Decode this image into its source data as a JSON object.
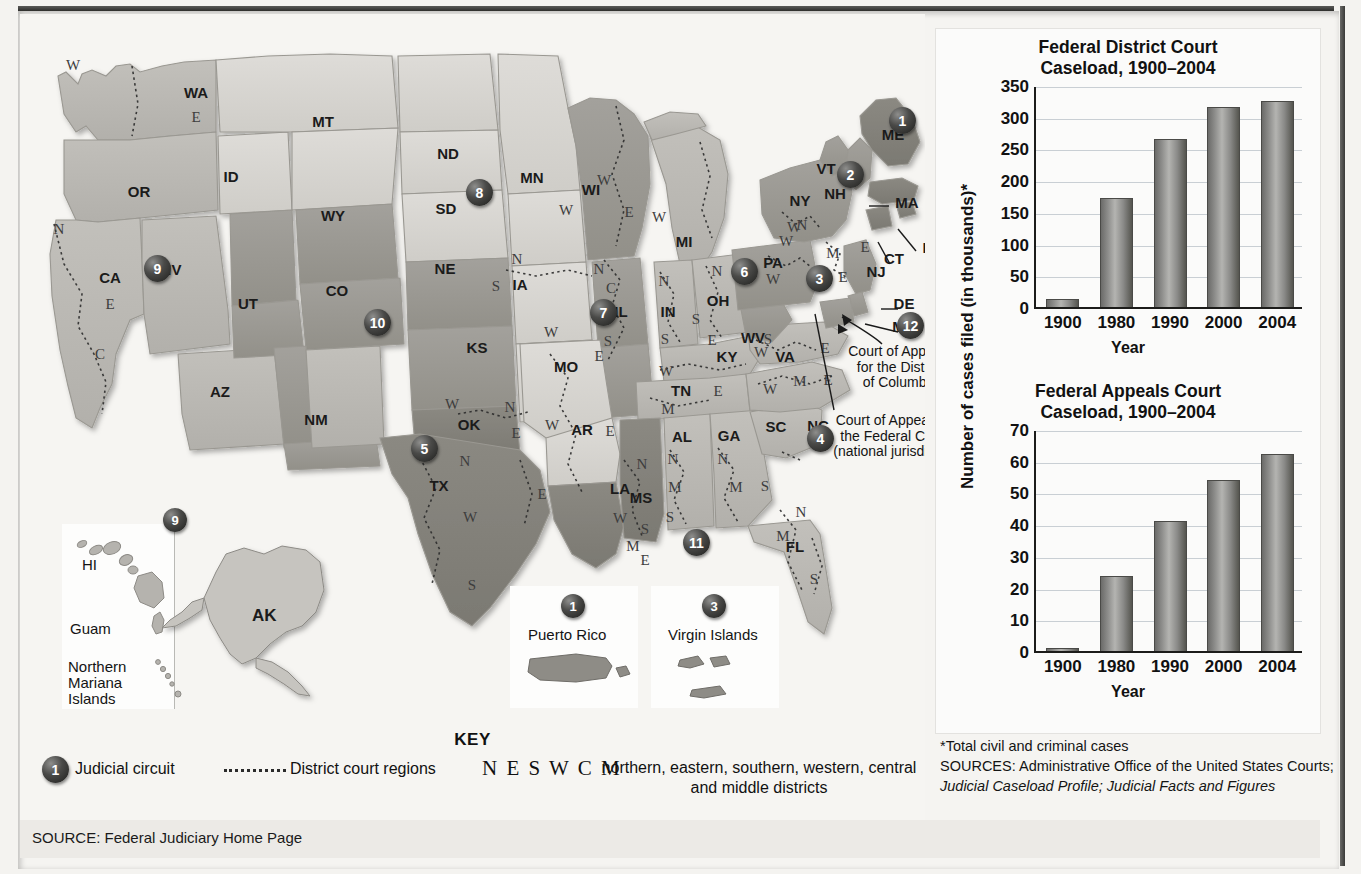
{
  "source_strip": {
    "text": "SOURCE: Federal Judiciary Home Page"
  },
  "key": {
    "title": "KEY",
    "circuit_badge": "1",
    "circuit_label": "Judicial circuit",
    "district_label": "District court regions",
    "neswcm": "N E S W C M",
    "neswcm_desc": "northern, eastern, southern, western, central and middle districts"
  },
  "map": {
    "states": [
      {
        "code": "WA",
        "x": 176,
        "y": 84
      },
      {
        "code": "OR",
        "x": 119,
        "y": 183
      },
      {
        "code": "ID",
        "x": 211,
        "y": 168
      },
      {
        "code": "MT",
        "x": 303,
        "y": 113
      },
      {
        "code": "WY",
        "x": 313,
        "y": 207
      },
      {
        "code": "NV",
        "x": 151,
        "y": 261
      },
      {
        "code": "CA",
        "x": 90,
        "y": 269
      },
      {
        "code": "UT",
        "x": 228,
        "y": 295
      },
      {
        "code": "CO",
        "x": 317,
        "y": 282
      },
      {
        "code": "AZ",
        "x": 200,
        "y": 383
      },
      {
        "code": "NM",
        "x": 296,
        "y": 411
      },
      {
        "code": "ND",
        "x": 428,
        "y": 145
      },
      {
        "code": "SD",
        "x": 426,
        "y": 200
      },
      {
        "code": "NE",
        "x": 425,
        "y": 260
      },
      {
        "code": "KS",
        "x": 457,
        "y": 339
      },
      {
        "code": "OK",
        "x": 449,
        "y": 416
      },
      {
        "code": "TX",
        "x": 419,
        "y": 477
      },
      {
        "code": "MN",
        "x": 512,
        "y": 169
      },
      {
        "code": "IA",
        "x": 500,
        "y": 276
      },
      {
        "code": "MO",
        "x": 546,
        "y": 358
      },
      {
        "code": "AR",
        "x": 562,
        "y": 421
      },
      {
        "code": "LA",
        "x": 600,
        "y": 480
      },
      {
        "code": "WI",
        "x": 571,
        "y": 181
      },
      {
        "code": "IL",
        "x": 601,
        "y": 303
      },
      {
        "code": "MI",
        "x": 664,
        "y": 233
      },
      {
        "code": "IN",
        "x": 648,
        "y": 303
      },
      {
        "code": "OH",
        "x": 698,
        "y": 292
      },
      {
        "code": "KY",
        "x": 707,
        "y": 348
      },
      {
        "code": "TN",
        "x": 661,
        "y": 382
      },
      {
        "code": "MS",
        "x": 621,
        "y": 489
      },
      {
        "code": "AL",
        "x": 662,
        "y": 428
      },
      {
        "code": "GA",
        "x": 709,
        "y": 427
      },
      {
        "code": "FL",
        "x": 775,
        "y": 538
      },
      {
        "code": "SC",
        "x": 756,
        "y": 418
      },
      {
        "code": "NC",
        "x": 798,
        "y": 417
      },
      {
        "code": "VA",
        "x": 765,
        "y": 348
      },
      {
        "code": "WV",
        "x": 733,
        "y": 329
      },
      {
        "code": "PA",
        "x": 753,
        "y": 254
      },
      {
        "code": "NY",
        "x": 780,
        "y": 192
      },
      {
        "code": "VT",
        "x": 806,
        "y": 160
      },
      {
        "code": "NH",
        "x": 815,
        "y": 185
      },
      {
        "code": "ME",
        "x": 873,
        "y": 126
      },
      {
        "code": "NJ",
        "x": 856,
        "y": 263
      },
      {
        "code": "MA",
        "x": 887,
        "y": 194
      },
      {
        "code": "RI",
        "x": 910,
        "y": 239
      },
      {
        "code": "CT",
        "x": 874,
        "y": 250
      },
      {
        "code": "DE",
        "x": 884,
        "y": 295
      },
      {
        "code": "MD",
        "x": 884,
        "y": 318
      },
      {
        "code": "AK",
        "x": 253,
        "y": 602
      },
      {
        "code": "HI",
        "x": 80,
        "y": 542
      }
    ],
    "district_letters": [
      {
        "t": "W",
        "x": 53,
        "y": 56
      },
      {
        "t": "E",
        "x": 176,
        "y": 108
      },
      {
        "t": "N",
        "x": 39,
        "y": 220
      },
      {
        "t": "E",
        "x": 90,
        "y": 295
      },
      {
        "t": "C",
        "x": 80,
        "y": 345
      },
      {
        "t": "N",
        "x": 497,
        "y": 250
      },
      {
        "t": "S",
        "x": 476,
        "y": 277
      },
      {
        "t": "W",
        "x": 584,
        "y": 171
      },
      {
        "t": "W",
        "x": 546,
        "y": 201
      },
      {
        "t": "E",
        "x": 609,
        "y": 203
      },
      {
        "t": "W",
        "x": 639,
        "y": 208
      },
      {
        "t": "N",
        "x": 579,
        "y": 260
      },
      {
        "t": "C",
        "x": 591,
        "y": 279
      },
      {
        "t": "S",
        "x": 588,
        "y": 332
      },
      {
        "t": "N",
        "x": 644,
        "y": 272
      },
      {
        "t": "S",
        "x": 645,
        "y": 330
      },
      {
        "t": "N",
        "x": 697,
        "y": 262
      },
      {
        "t": "S",
        "x": 676,
        "y": 310
      },
      {
        "t": "E",
        "x": 692,
        "y": 331
      },
      {
        "t": "W",
        "x": 531,
        "y": 323
      },
      {
        "t": "E",
        "x": 579,
        "y": 347
      },
      {
        "t": "W",
        "x": 432,
        "y": 395
      },
      {
        "t": "N",
        "x": 490,
        "y": 398
      },
      {
        "t": "E",
        "x": 496,
        "y": 424
      },
      {
        "t": "W",
        "x": 532,
        "y": 416
      },
      {
        "t": "E",
        "x": 590,
        "y": 422
      },
      {
        "t": "N",
        "x": 445,
        "y": 452
      },
      {
        "t": "W",
        "x": 450,
        "y": 508
      },
      {
        "t": "S",
        "x": 452,
        "y": 576
      },
      {
        "t": "E",
        "x": 522,
        "y": 485
      },
      {
        "t": "W",
        "x": 600,
        "y": 509
      },
      {
        "t": "M",
        "x": 613,
        "y": 537
      },
      {
        "t": "E",
        "x": 625,
        "y": 551
      },
      {
        "t": "N",
        "x": 622,
        "y": 455
      },
      {
        "t": "S",
        "x": 625,
        "y": 520
      },
      {
        "t": "N",
        "x": 653,
        "y": 450
      },
      {
        "t": "M",
        "x": 655,
        "y": 478
      },
      {
        "t": "S",
        "x": 650,
        "y": 508
      },
      {
        "t": "N",
        "x": 703,
        "y": 450
      },
      {
        "t": "M",
        "x": 716,
        "y": 478
      },
      {
        "t": "S",
        "x": 745,
        "y": 477
      },
      {
        "t": "N",
        "x": 781,
        "y": 503
      },
      {
        "t": "M",
        "x": 763,
        "y": 527
      },
      {
        "t": "S",
        "x": 794,
        "y": 570
      },
      {
        "t": "W",
        "x": 646,
        "y": 362
      },
      {
        "t": "M",
        "x": 648,
        "y": 400
      },
      {
        "t": "E",
        "x": 698,
        "y": 382
      },
      {
        "t": "W",
        "x": 750,
        "y": 380
      },
      {
        "t": "M",
        "x": 780,
        "y": 372
      },
      {
        "t": "E",
        "x": 808,
        "y": 371
      },
      {
        "t": "W",
        "x": 741,
        "y": 343
      },
      {
        "t": "S",
        "x": 748,
        "y": 330
      },
      {
        "t": "E",
        "x": 805,
        "y": 339
      },
      {
        "t": "W",
        "x": 753,
        "y": 270
      },
      {
        "t": "W",
        "x": 774,
        "y": 218
      },
      {
        "t": "M",
        "x": 813,
        "y": 244
      },
      {
        "t": "N",
        "x": 782,
        "y": 216
      },
      {
        "t": "E",
        "x": 845,
        "y": 238
      },
      {
        "t": "E",
        "x": 823,
        "y": 268
      },
      {
        "t": "W",
        "x": 766,
        "y": 232
      }
    ],
    "badges": [
      {
        "n": "1",
        "x": 869,
        "y": 93,
        "size": "big"
      },
      {
        "n": "2",
        "x": 817,
        "y": 147,
        "size": "big"
      },
      {
        "n": "3",
        "x": 786,
        "y": 251,
        "size": "big"
      },
      {
        "n": "4",
        "x": 787,
        "y": 411,
        "size": "big"
      },
      {
        "n": "5",
        "x": 391,
        "y": 421,
        "size": "big"
      },
      {
        "n": "6",
        "x": 711,
        "y": 244,
        "size": "big"
      },
      {
        "n": "7",
        "x": 570,
        "y": 285,
        "size": "big"
      },
      {
        "n": "8",
        "x": 446,
        "y": 165,
        "size": "big"
      },
      {
        "n": "9",
        "x": 124,
        "y": 241,
        "size": "big"
      },
      {
        "n": "10",
        "x": 344,
        "y": 295,
        "size": "big"
      },
      {
        "n": "11",
        "x": 663,
        "y": 515,
        "size": "big"
      },
      {
        "n": "12",
        "x": 877,
        "y": 298,
        "size": "big"
      }
    ],
    "notes": [
      {
        "lines": [
          "Court of Appeals",
          "for the District",
          "of Columbia"
        ],
        "x": 800,
        "y": 330,
        "w": 160
      },
      {
        "lines": [
          "Court of Appeals for",
          "the Federal Circuit",
          "(national jurisdiction)"
        ],
        "x": 790,
        "y": 399,
        "w": 175
      }
    ],
    "insets": [
      {
        "name": "hawaii",
        "label": "HI"
      },
      {
        "name": "guam",
        "label": "Guam"
      },
      {
        "name": "northern-mariana",
        "label": "Northern\nMariana\nIslands"
      },
      {
        "name": "puerto-rico",
        "label": "Puerto Rico",
        "badge": "1"
      },
      {
        "name": "virgin-islands",
        "label": "Virgin Islands",
        "badge": "3"
      },
      {
        "name": "pacific-group",
        "badge": "9"
      }
    ],
    "inset_labels": {
      "hi": "HI",
      "guam": "Guam",
      "nmi_1": "Northern",
      "nmi_2": "Mariana",
      "nmi_3": "Islands",
      "ak": "AK",
      "pr": "Puerto Rico",
      "vi": "Virgin Islands",
      "pr_badge": "1",
      "vi_badge": "3",
      "pac_badge": "9"
    }
  },
  "charts": {
    "notes": {
      "footnote": "*Total civil and criminal cases",
      "sources_line1": "SOURCES: Administrative Office of the United States Courts;",
      "sources_line2": "Judicial Caseload Profile; Judicial Facts and Figures"
    },
    "shared_ylabel": "Number of cases filed (in thousands)*"
  },
  "chart_data": [
    {
      "type": "bar",
      "name": "district-court",
      "title": "Federal District Court\nCaseload, 1900–2004",
      "title_line1": "Federal District Court",
      "title_line2": "Caseload, 1900–2004",
      "categories": [
        "1900",
        "1980",
        "1990",
        "2000",
        "2004"
      ],
      "values": [
        12,
        172,
        265,
        315,
        325
      ],
      "xlabel": "Year",
      "ylabel": "Number of cases filed (in thousands)*",
      "ylim": [
        0,
        350
      ],
      "yticks": [
        0,
        50,
        100,
        150,
        200,
        250,
        300,
        350
      ],
      "grid": true,
      "legend": "none"
    },
    {
      "type": "bar",
      "name": "appeals-court",
      "title": "Federal Appeals Court\nCaseload, 1900–2004",
      "title_line1": "Federal Appeals Court",
      "title_line2": "Caseload, 1900–2004",
      "categories": [
        "1900",
        "1980",
        "1990",
        "2000",
        "2004"
      ],
      "values": [
        0.6,
        23.5,
        41,
        54,
        62
      ],
      "xlabel": "Year",
      "ylabel": "Number of cases",
      "ylim": [
        0,
        70
      ],
      "yticks": [
        0,
        10,
        20,
        30,
        40,
        50,
        60,
        70
      ],
      "grid": true,
      "legend": "none"
    }
  ]
}
